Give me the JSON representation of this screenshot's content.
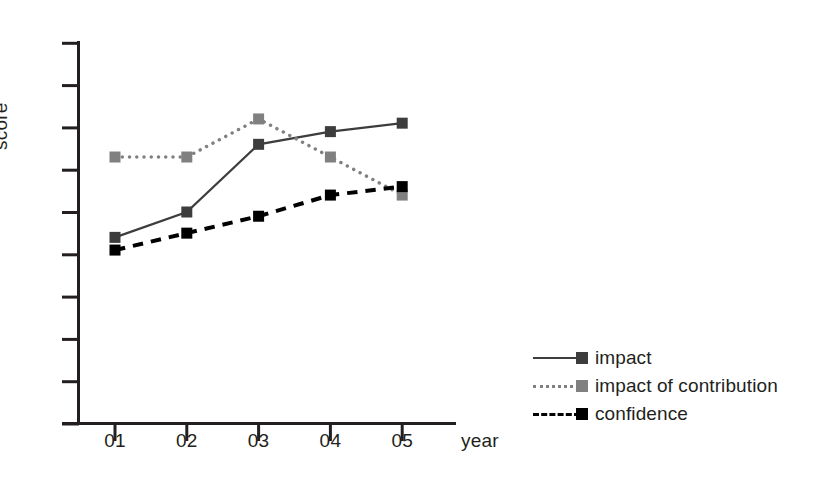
{
  "chart_data": {
    "type": "line",
    "title": "",
    "xlabel": "year",
    "ylabel": "score",
    "categories": [
      "01",
      "02",
      "03",
      "04",
      "05"
    ],
    "x": [
      1,
      2,
      3,
      4,
      5
    ],
    "xlim": [
      0.5,
      5.5
    ],
    "ylim": [
      0,
      9
    ],
    "yticks": [
      0,
      1,
      2,
      3,
      4,
      5,
      6,
      7,
      8,
      9
    ],
    "ytick_labels": [
      "",
      "",
      "",
      "",
      "",
      "",
      "",
      "",
      "",
      ""
    ],
    "grid": false,
    "legend_position": "lower-right-outside",
    "series": [
      {
        "name": "impact",
        "values": [
          4.4,
          5.0,
          6.6,
          6.9,
          7.1
        ],
        "color": "#3d3d3d",
        "linestyle": "solid",
        "marker": "square"
      },
      {
        "name": "impact of contribution",
        "values": [
          6.3,
          6.3,
          7.2,
          6.3,
          5.4
        ],
        "color": "#808080",
        "linestyle": "dotted",
        "marker": "square"
      },
      {
        "name": "confidence",
        "values": [
          4.1,
          4.5,
          4.9,
          5.4,
          5.6
        ],
        "color": "#000000",
        "linestyle": "dashed",
        "marker": "square"
      }
    ]
  },
  "axes": {
    "y_label": "score",
    "x_label": "year",
    "x_tick_labels": [
      "01",
      "02",
      "03",
      "04",
      "05"
    ],
    "axis_color": "#231f20"
  },
  "legend": {
    "entries": [
      {
        "label": "impact",
        "color": "#3d3d3d",
        "style": "solid"
      },
      {
        "label": "impact of contribution",
        "color": "#808080",
        "style": "dotted"
      },
      {
        "label": "confidence",
        "color": "#000000",
        "style": "dashed"
      }
    ]
  },
  "colors": {
    "impact": "#3d3d3d",
    "impact_of_contribution": "#808080",
    "confidence": "#000000",
    "axis": "#231f20",
    "background": "#ffffff"
  }
}
